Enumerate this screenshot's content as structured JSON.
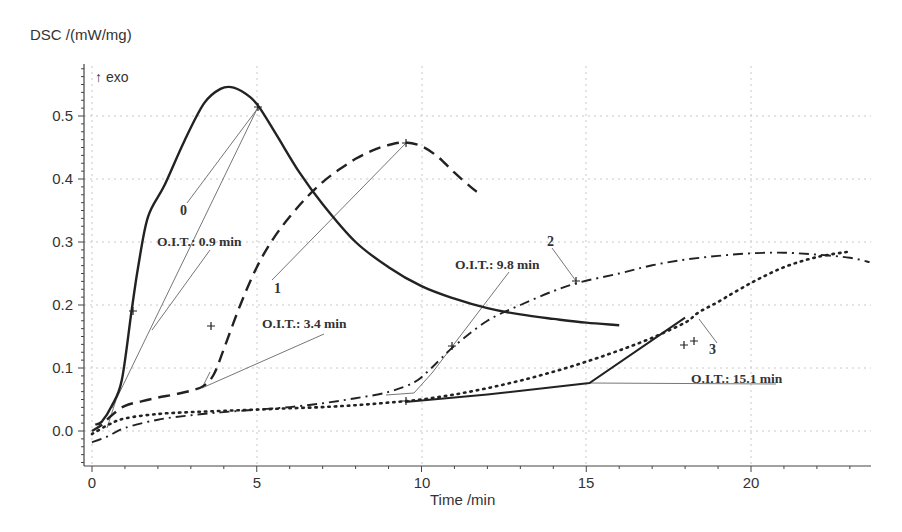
{
  "chart_data": {
    "type": "line",
    "title": "",
    "ylabel": "DSC /(mW/mg)",
    "xlabel": "Time /min",
    "direction_label": "↑ exo",
    "xlim": [
      -0.1,
      23.6
    ],
    "ylim": [
      -0.055,
      0.58
    ],
    "x_ticks": [
      0,
      5,
      10,
      15,
      20
    ],
    "x_tick_labels": [
      "0",
      "5",
      "10",
      "15",
      "20"
    ],
    "y_ticks": [
      0.0,
      0.1,
      0.2,
      0.3,
      0.4,
      0.5
    ],
    "y_tick_labels": [
      "0.0",
      "0.1",
      "0.2",
      "0.3",
      "0.4",
      "0.5"
    ],
    "grid": true,
    "legend": "none (curves labeled inline)",
    "series": [
      {
        "name": "0",
        "style": "solid",
        "x": [
          0.1,
          0.3,
          0.6,
          0.9,
          1.2,
          1.4,
          1.7,
          2.2,
          2.8,
          3.4,
          3.9,
          4.3,
          4.8,
          5.1,
          5.6,
          6.3,
          7.0,
          8.0,
          9.0,
          10.0,
          11.0,
          12.0,
          13.0,
          14.0,
          15.0,
          16.0
        ],
        "values": [
          0.01,
          0.015,
          0.04,
          0.08,
          0.19,
          0.26,
          0.34,
          0.39,
          0.46,
          0.52,
          0.543,
          0.545,
          0.53,
          0.512,
          0.47,
          0.41,
          0.36,
          0.3,
          0.26,
          0.23,
          0.21,
          0.195,
          0.185,
          0.178,
          0.172,
          0.168
        ]
      },
      {
        "name": "1",
        "style": "dashed",
        "x": [
          0.0,
          0.3,
          0.6,
          1.0,
          1.5,
          2.0,
          2.5,
          3.0,
          3.4,
          3.7,
          4.0,
          4.5,
          5.0,
          5.5,
          6.0,
          6.5,
          7.0,
          7.5,
          8.0,
          8.5,
          9.0,
          9.5,
          10.0,
          10.5,
          11.0,
          11.5,
          11.8
        ],
        "values": [
          0.0,
          0.01,
          0.025,
          0.04,
          0.047,
          0.053,
          0.058,
          0.064,
          0.072,
          0.09,
          0.13,
          0.2,
          0.26,
          0.305,
          0.34,
          0.37,
          0.395,
          0.415,
          0.432,
          0.445,
          0.454,
          0.458,
          0.452,
          0.435,
          0.41,
          0.387,
          0.375
        ]
      },
      {
        "name": "2",
        "style": "dash-dot",
        "x": [
          0.0,
          0.5,
          1.0,
          2.0,
          3.0,
          4.0,
          5.0,
          6.0,
          7.0,
          8.0,
          9.0,
          9.8,
          10.3,
          11.0,
          12.0,
          13.0,
          14.0,
          14.8,
          16.0,
          17.0,
          18.0,
          19.0,
          20.0,
          21.0,
          22.0,
          23.0,
          23.6
        ],
        "values": [
          -0.018,
          -0.008,
          0.005,
          0.018,
          0.025,
          0.03,
          0.034,
          0.038,
          0.044,
          0.052,
          0.062,
          0.078,
          0.1,
          0.135,
          0.175,
          0.2,
          0.222,
          0.236,
          0.25,
          0.263,
          0.272,
          0.278,
          0.282,
          0.283,
          0.28,
          0.275,
          0.268
        ]
      },
      {
        "name": "3",
        "style": "dotted",
        "x": [
          0.0,
          0.5,
          1.0,
          2.0,
          3.0,
          4.0,
          5.0,
          6.0,
          7.0,
          8.0,
          9.0,
          10.0,
          11.0,
          12.0,
          13.0,
          14.0,
          15.0,
          16.0,
          17.0,
          18.0,
          18.4,
          19.0,
          20.0,
          21.0,
          22.0,
          23.0
        ],
        "values": [
          -0.005,
          0.01,
          0.02,
          0.027,
          0.03,
          0.032,
          0.034,
          0.036,
          0.038,
          0.041,
          0.045,
          0.05,
          0.058,
          0.068,
          0.08,
          0.094,
          0.11,
          0.128,
          0.148,
          0.172,
          0.188,
          0.205,
          0.235,
          0.26,
          0.276,
          0.285
        ]
      },
      {
        "name": "3 (solid segment)",
        "style": "solid",
        "x": [
          9.5,
          12.0,
          15.1,
          18.0
        ],
        "values": [
          0.046,
          0.058,
          0.076,
          0.18
        ]
      }
    ],
    "annotations": [
      {
        "text": "0",
        "x": 2.8,
        "y": 0.345
      },
      {
        "text": "O.I.T.: 0.9 min",
        "x": 2.0,
        "y": 0.29
      },
      {
        "text": "1",
        "x": 5.6,
        "y": 0.23
      },
      {
        "text": "O.I.T.: 3.4 min",
        "x": 4.3,
        "y": 0.165
      },
      {
        "text": "2",
        "x": 13.8,
        "y": 0.305
      },
      {
        "text": "O.I.T.: 9.8 min",
        "x": 11.0,
        "y": 0.265
      },
      {
        "text": "3",
        "x": 18.5,
        "y": 0.12
      },
      {
        "text": "O.I.T.: 15.1 min",
        "x": 18.2,
        "y": 0.085
      }
    ]
  },
  "labels": {
    "ylabel": "DSC /(mW/mg)",
    "xlabel": "Time /min",
    "exo": "↑ exo",
    "curve0": "0",
    "curve1": "1",
    "curve2": "2",
    "curve3": "3",
    "oit0": "O.I.T.: 0.9 min",
    "oit1": "O.I.T.: 3.4 min",
    "oit2": "O.I.T.: 9.8 min",
    "oit3": "O.I.T.: 15.1 min",
    "xt0": "0",
    "xt5": "5",
    "xt10": "10",
    "xt15": "15",
    "xt20": "20",
    "yt0": "0.0",
    "yt1": "0.1",
    "yt2": "0.2",
    "yt3": "0.3",
    "yt4": "0.4",
    "yt5": "0.5"
  }
}
